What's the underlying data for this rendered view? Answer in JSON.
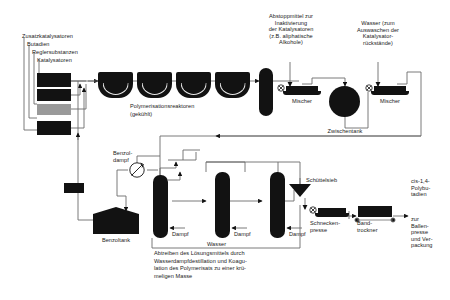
{
  "diagram": {
    "line_color": "#6b6b6b",
    "vessel_color": "#121212",
    "grey_feed_color": "#9a9a9a",
    "background": "#ffffff"
  },
  "feeds": {
    "header": "Zusatzkatalysatoren",
    "items": [
      {
        "label": "Butadien"
      },
      {
        "label": "Reglersubstanzen"
      },
      {
        "label": "Katalysatoren"
      }
    ],
    "boxes": [
      {
        "name": "feed-box-1",
        "fill": "black"
      },
      {
        "name": "feed-box-2",
        "fill": "black"
      },
      {
        "name": "feed-box-3",
        "fill": "grey"
      },
      {
        "name": "feed-box-4",
        "fill": "black"
      }
    ]
  },
  "reactors": {
    "caption_line1": "Polymerisationsreaktoren",
    "caption_line2": "(gekühlt)",
    "count": 4
  },
  "additives": {
    "stopper": "Abstoppmittel zur\nInaktivierung\nder Katalysatoren\n(z.B. aliphatische\nAlkohole)",
    "water_wash": "Wasser (zum\nAuswaschen der\nKatalysator-\nrückstände)"
  },
  "units": {
    "mixer_1": "Mischer",
    "mixer_2": "Mischer",
    "intermediate_tank": "Zwischentank",
    "benzene_vapour": "Benzol-\ndampf",
    "benzene_tank": "Benzoltank",
    "steam_1": "Dampf",
    "steam_2": "Dampf",
    "steam_3": "Dampf",
    "water": "Wasser",
    "shaker_sieve": "Schüttelsieb",
    "screw_press": "Schnecken-\npresse",
    "belt_dryer": "Band-\ntrockner"
  },
  "captions": {
    "stripping": "Abtreiben des Lösungsmittels durch\nWasserdampfdestillation und Koagu-\nlation des Polymerisats zu einer krü-\nmeligen Masse"
  },
  "product": {
    "name": "cis-1,4-\nPolybu-\ntadien",
    "destination": "zur\nBallen-\npresse\nund Ver-\npackung"
  }
}
